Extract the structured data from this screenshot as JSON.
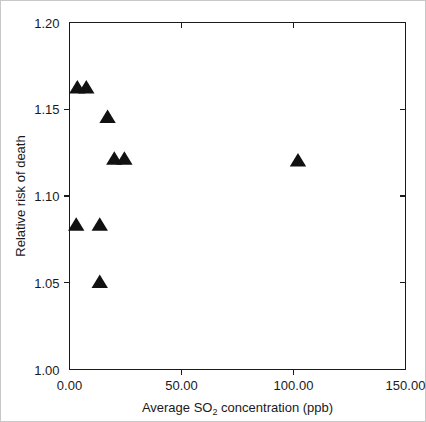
{
  "chart_data": {
    "type": "scatter",
    "title": "",
    "xlabel": "Average SO2 concentration (ppb)",
    "xlabel_prefix": "Average SO",
    "xlabel_subscript": "2",
    "xlabel_suffix": " concentration (ppb)",
    "ylabel": "Relative risk of death",
    "xlim": [
      0,
      150
    ],
    "ylim": [
      1.0,
      1.2
    ],
    "xticks": [
      0,
      50,
      100,
      150
    ],
    "xtick_labels": [
      "0.00",
      "50.00",
      "100.00",
      "150.00"
    ],
    "yticks": [
      1.0,
      1.05,
      1.1,
      1.15,
      1.2
    ],
    "ytick_labels": [
      "1.00",
      "1.05",
      "1.10",
      "1.15",
      "1.20"
    ],
    "grid": false,
    "legend": null,
    "marker": "triangle-up",
    "marker_color": "#111111",
    "points": [
      {
        "x": 3.5,
        "y": 1.162
      },
      {
        "x": 7.5,
        "y": 1.162
      },
      {
        "x": 17.0,
        "y": 1.145
      },
      {
        "x": 20.0,
        "y": 1.121
      },
      {
        "x": 24.5,
        "y": 1.121
      },
      {
        "x": 3.0,
        "y": 1.083
      },
      {
        "x": 13.5,
        "y": 1.083
      },
      {
        "x": 13.5,
        "y": 1.05
      },
      {
        "x": 102.0,
        "y": 1.12
      }
    ]
  }
}
